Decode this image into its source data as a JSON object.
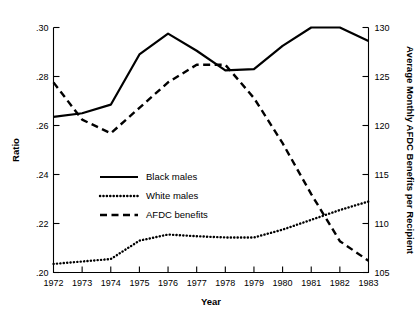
{
  "chart_data": {
    "type": "line",
    "title": "",
    "xlabel": "Year",
    "ylabel": "Ratio",
    "y2label": "Average Monthly AFDC Benefits per Recipient",
    "x": [
      1972,
      1973,
      1974,
      1975,
      1976,
      1977,
      1978,
      1979,
      1980,
      1981,
      1982,
      1983
    ],
    "categories": [
      "1972",
      "1973",
      "1974",
      "1975",
      "1976",
      "1977",
      "1978",
      "1979",
      "1980",
      "1981",
      "1982",
      "1983"
    ],
    "xlim": [
      1972,
      1983
    ],
    "ylim": [
      0.2,
      0.3
    ],
    "y2lim": [
      105,
      130
    ],
    "yticks": [
      0.2,
      0.22,
      0.24,
      0.26,
      0.28,
      0.3
    ],
    "ytick_labels": [
      ".20",
      ".22",
      ".24",
      ".26",
      ".28",
      ".30"
    ],
    "y2ticks": [
      105,
      110,
      115,
      120,
      125,
      130
    ],
    "y2tick_labels": [
      "105",
      "110",
      "115",
      "120",
      "125",
      "130"
    ],
    "grid": false,
    "legend_position": "center-left",
    "series": [
      {
        "name": "Black males",
        "style": "solid",
        "axis": "left",
        "values": [
          0.2635,
          0.265,
          0.2685,
          0.289,
          0.2975,
          0.2905,
          0.2825,
          0.283,
          0.2925,
          0.3,
          0.3,
          0.2945
        ]
      },
      {
        "name": "White males",
        "style": "dotted",
        "axis": "left",
        "values": [
          0.2035,
          0.2045,
          0.2055,
          0.213,
          0.2155,
          0.2148,
          0.2143,
          0.2143,
          0.2175,
          0.2215,
          0.2255,
          0.229
        ]
      },
      {
        "name": "AFDC benefits",
        "style": "dashed",
        "axis": "right",
        "values": [
          124.4,
          120.6,
          119.2,
          121.8,
          124.4,
          126.2,
          126.2,
          122.8,
          118.2,
          113.0,
          108.2,
          106.2
        ]
      }
    ]
  },
  "legend": {
    "items": [
      {
        "label": "Black males",
        "style": "solid"
      },
      {
        "label": "White males",
        "style": "dotted"
      },
      {
        "label": "AFDC benefits",
        "style": "dashed"
      }
    ]
  },
  "axes": {
    "x_title": "Year",
    "y_title": "Ratio",
    "y2_title": "Average Monthly AFDC Benefits per Recipient"
  }
}
